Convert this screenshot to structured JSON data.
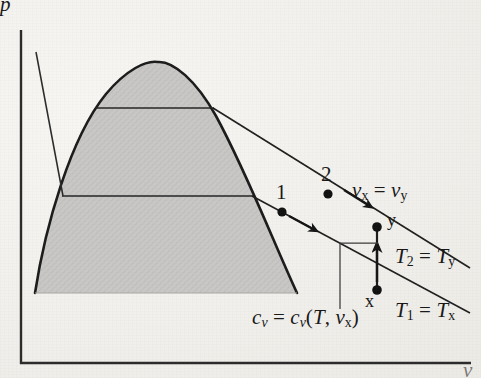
{
  "figure": {
    "type": "thermodynamic-pv-diagram",
    "background_color": "#f3f2ef",
    "ink_color": "#171717",
    "dome_fill_color": "#c9c8c6"
  },
  "axes": {
    "y_label": "p",
    "x_label": "v",
    "y_axis_x": 21,
    "x_axis_y": 363,
    "x_axis_x_end": 470,
    "y_axis_y_top": 30
  },
  "dome": {
    "name": "vapor-dome",
    "apex": [
      157,
      63
    ],
    "base_y": 293,
    "base_left_x": 35,
    "base_right_x": 297,
    "path": "M 35 293 C 45 230 70 140 105 95 C 125 70 145 61 157 63 C 172 62 195 80 215 115 C 245 170 272 240 297 293 Z"
  },
  "quality_lines": [
    {
      "name": "upper-quality-line",
      "y": 108,
      "x1": 95,
      "x2": 213
    },
    {
      "name": "lower-quality-line",
      "y": 196,
      "x1": 62,
      "x2": 252
    }
  ],
  "liquid_isotherm": {
    "name": "compressed-liquid-isotherm",
    "x1": 36,
    "y1": 52,
    "x2": 63,
    "y2": 196
  },
  "isotherms": [
    {
      "name": "isotherm-T1",
      "label": "T₁ = Tx",
      "label_T": "T",
      "label_sub1": "1",
      "label_eq": "=",
      "label_T2": "T",
      "label_sub2": "x",
      "label_x": 396,
      "label_y": 305,
      "x1": 252,
      "y1": 196,
      "x2": 470,
      "y2": 313,
      "arrow_at": [
        310,
        241
      ],
      "points": [
        {
          "name": "state-point-1",
          "label": "1",
          "cx": 282,
          "cy": 212,
          "label_x": 276,
          "label_y": 190
        },
        {
          "name": "state-point-x",
          "label": "x",
          "cx": 377,
          "cy": 290,
          "label_x": 368,
          "label_y": 292
        }
      ]
    },
    {
      "name": "isotherm-T2",
      "label": "T₂ = Ty",
      "label_T": "T",
      "label_sub1": "2",
      "label_eq": "=",
      "label_T2": "T",
      "label_sub2": "y",
      "label_x": 396,
      "label_y": 251,
      "x1": 213,
      "y1": 108,
      "x2": 470,
      "y2": 268,
      "arrow_at": [
        366,
        204
      ],
      "points": [
        {
          "name": "state-point-2",
          "label": "2",
          "cx": 328,
          "cy": 194,
          "label_x": 321,
          "label_y": 172
        },
        {
          "name": "state-point-y",
          "label": "y",
          "cx": 377,
          "cy": 227,
          "label_x": 386,
          "label_y": 215
        }
      ]
    }
  ],
  "constant_volume_process": {
    "name": "constant-volume-process-x-to-y",
    "x": 377,
    "y_start": 290,
    "y_end": 227,
    "arrow_tip_y": 248
  },
  "annotations": {
    "specific_volume_equality": {
      "name": "specific-volume-equality-label",
      "text": "vx = vy",
      "v1": "v",
      "sub1": "x",
      "eq": "=",
      "v2": "v",
      "sub2": "y",
      "x": 351,
      "y": 190
    },
    "specific_heat": {
      "name": "specific-heat-label",
      "text": "cv = cv(T, vx)",
      "c1": "c",
      "sub_c1": "v",
      "eq": "=",
      "c2": "c",
      "sub_c2": "v",
      "open": "(",
      "T": "T",
      "comma": ",",
      "v": "v",
      "sub_v": "x",
      "close": ")",
      "x": 255,
      "y": 313
    },
    "leader": {
      "name": "specific-heat-leader-line",
      "path": "M 340 308 L 340 243 L 377 243"
    }
  }
}
